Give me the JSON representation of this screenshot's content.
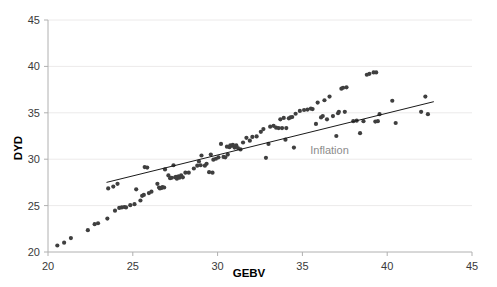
{
  "chart_data": {
    "type": "scatter",
    "title": "",
    "xlabel": "GEBV",
    "ylabel": "DYD",
    "xlim": [
      20,
      45
    ],
    "ylim": [
      20,
      45
    ],
    "xticks": [
      20,
      25,
      30,
      35,
      40,
      45
    ],
    "yticks": [
      20,
      25,
      30,
      35,
      40,
      45
    ],
    "grid": "horizontal-faint",
    "legend": "none",
    "marker_color": "#3f3f3f",
    "line_color": "#1a1a1a",
    "annotation_color": "#8c8c8c",
    "annotations": [
      {
        "text": "Inflation",
        "x": 36.6,
        "y": 30.6
      }
    ],
    "series": [
      {
        "name": "DYD vs GEBV",
        "type": "scatter",
        "points": [
          [
            20.55,
            20.7
          ],
          [
            20.95,
            21.0
          ],
          [
            21.35,
            21.5
          ],
          [
            22.35,
            22.35
          ],
          [
            22.75,
            23.0
          ],
          [
            22.95,
            23.1
          ],
          [
            23.5,
            23.6
          ],
          [
            23.55,
            26.85
          ],
          [
            23.85,
            27.05
          ],
          [
            23.95,
            24.45
          ],
          [
            24.1,
            27.35
          ],
          [
            24.2,
            24.75
          ],
          [
            24.35,
            24.8
          ],
          [
            24.5,
            24.85
          ],
          [
            24.6,
            24.8
          ],
          [
            24.85,
            25.05
          ],
          [
            25.1,
            25.15
          ],
          [
            25.2,
            26.75
          ],
          [
            25.45,
            25.55
          ],
          [
            25.55,
            26.05
          ],
          [
            25.65,
            26.15
          ],
          [
            25.7,
            29.15
          ],
          [
            25.85,
            29.1
          ],
          [
            25.95,
            26.35
          ],
          [
            26.1,
            26.5
          ],
          [
            26.45,
            27.35
          ],
          [
            26.55,
            26.95
          ],
          [
            26.6,
            26.85
          ],
          [
            26.7,
            26.9
          ],
          [
            26.75,
            27.0
          ],
          [
            26.85,
            26.95
          ],
          [
            26.9,
            28.9
          ],
          [
            27.1,
            28.25
          ],
          [
            27.2,
            27.95
          ],
          [
            27.3,
            28.0
          ],
          [
            27.4,
            29.35
          ],
          [
            27.5,
            28.05
          ],
          [
            27.55,
            28.1
          ],
          [
            27.6,
            27.9
          ],
          [
            27.7,
            28.15
          ],
          [
            27.75,
            28.0
          ],
          [
            27.85,
            28.25
          ],
          [
            27.95,
            28.05
          ],
          [
            28.1,
            28.55
          ],
          [
            28.3,
            28.55
          ],
          [
            28.6,
            29.0
          ],
          [
            28.8,
            29.3
          ],
          [
            28.9,
            29.75
          ],
          [
            29.0,
            29.35
          ],
          [
            29.05,
            30.4
          ],
          [
            29.25,
            29.3
          ],
          [
            29.35,
            29.5
          ],
          [
            29.5,
            28.6
          ],
          [
            29.6,
            30.5
          ],
          [
            29.7,
            28.55
          ],
          [
            29.75,
            29.95
          ],
          [
            29.9,
            30.05
          ],
          [
            30.05,
            30.2
          ],
          [
            30.2,
            31.65
          ],
          [
            30.35,
            30.25
          ],
          [
            30.45,
            30.2
          ],
          [
            30.55,
            31.35
          ],
          [
            30.6,
            30.5
          ],
          [
            30.7,
            31.3
          ],
          [
            30.75,
            31.5
          ],
          [
            30.85,
            31.45
          ],
          [
            30.9,
            31.55
          ],
          [
            31.0,
            31.25
          ],
          [
            31.1,
            31.5
          ],
          [
            31.2,
            31.2
          ],
          [
            31.35,
            31.05
          ],
          [
            31.5,
            31.8
          ],
          [
            31.7,
            32.3
          ],
          [
            31.9,
            32.0
          ],
          [
            32.05,
            32.4
          ],
          [
            32.3,
            32.45
          ],
          [
            32.55,
            32.95
          ],
          [
            32.7,
            33.25
          ],
          [
            32.85,
            30.15
          ],
          [
            33.0,
            31.65
          ],
          [
            33.1,
            33.5
          ],
          [
            33.3,
            33.6
          ],
          [
            33.45,
            33.4
          ],
          [
            33.6,
            33.35
          ],
          [
            33.7,
            34.3
          ],
          [
            33.8,
            33.35
          ],
          [
            33.9,
            34.45
          ],
          [
            34.0,
            32.1
          ],
          [
            34.05,
            33.35
          ],
          [
            34.2,
            34.4
          ],
          [
            34.3,
            34.5
          ],
          [
            34.4,
            34.55
          ],
          [
            34.5,
            31.25
          ],
          [
            34.6,
            34.9
          ],
          [
            34.85,
            35.2
          ],
          [
            35.1,
            35.3
          ],
          [
            35.3,
            35.35
          ],
          [
            35.5,
            35.45
          ],
          [
            35.6,
            35.4
          ],
          [
            35.8,
            33.8
          ],
          [
            35.9,
            36.1
          ],
          [
            36.1,
            34.5
          ],
          [
            36.2,
            34.65
          ],
          [
            36.3,
            36.35
          ],
          [
            36.45,
            34.3
          ],
          [
            36.6,
            36.75
          ],
          [
            36.8,
            34.65
          ],
          [
            37.0,
            32.5
          ],
          [
            37.1,
            34.95
          ],
          [
            37.15,
            35.1
          ],
          [
            37.3,
            37.6
          ],
          [
            37.4,
            37.7
          ],
          [
            37.5,
            35.1
          ],
          [
            37.6,
            37.75
          ],
          [
            38.0,
            34.1
          ],
          [
            38.2,
            34.15
          ],
          [
            38.4,
            32.8
          ],
          [
            38.6,
            34.1
          ],
          [
            38.8,
            39.1
          ],
          [
            38.95,
            39.2
          ],
          [
            39.2,
            39.35
          ],
          [
            39.35,
            39.35
          ],
          [
            39.3,
            34.05
          ],
          [
            39.45,
            34.1
          ],
          [
            39.55,
            34.85
          ],
          [
            40.3,
            36.3
          ],
          [
            40.5,
            33.9
          ],
          [
            42.0,
            35.1
          ],
          [
            42.25,
            36.75
          ],
          [
            42.4,
            34.85
          ]
        ]
      },
      {
        "name": "Inflation trend line",
        "type": "line",
        "points": [
          [
            23.45,
            27.5
          ],
          [
            42.75,
            36.2
          ]
        ]
      }
    ]
  },
  "axes": {
    "y_axis_title": "DYD",
    "x_axis_title": "GEBV"
  }
}
